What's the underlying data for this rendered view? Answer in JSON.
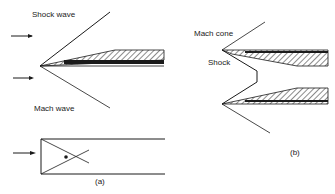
{
  "figure": {
    "panel_a": {
      "labels": {
        "shock_wave": "Shock wave",
        "mach_wave": "Mach wave",
        "caption": "(a)"
      }
    },
    "panel_b": {
      "labels": {
        "mach_cone": "Mach cone",
        "shock": "Shock",
        "caption": "(b)"
      }
    },
    "colors": {
      "line": "#1a1a1a",
      "background": "#ffffff"
    }
  }
}
